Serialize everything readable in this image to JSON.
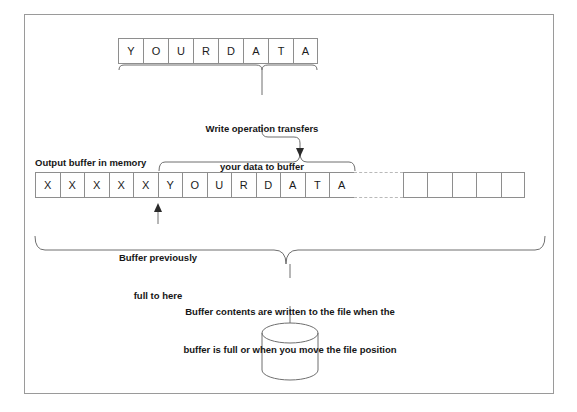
{
  "figure": {
    "border_color": "#9a9a9a",
    "line_color": "#8e8e8e",
    "text_color": "#161616"
  },
  "source_row": {
    "name": "your data",
    "cells": [
      "Y",
      "O",
      "U",
      "R",
      "D",
      "A",
      "T",
      "A"
    ]
  },
  "buffer": {
    "title": "Output buffer in memory",
    "filled_cells": [
      "X",
      "X",
      "X",
      "X",
      "X"
    ],
    "data_cells": [
      "Y",
      "O",
      "U",
      "R",
      "D",
      "A",
      "T",
      "A"
    ],
    "gap_cell": "",
    "empty_cells": [
      "",
      "",
      "",
      "",
      ""
    ]
  },
  "annotations": {
    "write": {
      "line1": "Write operation transfers",
      "line2": "your data to buffer"
    },
    "previously_full": {
      "line1": "Buffer previously",
      "line2": "full to here"
    },
    "flush": {
      "line1": "Buffer contents are written to the file when the",
      "line2": "buffer is full or when you move the file position"
    }
  },
  "icons": {
    "file_storage": "cylinder-icon"
  }
}
